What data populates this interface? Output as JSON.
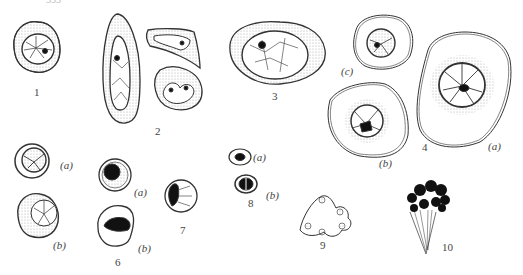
{
  "figure": {
    "top_fragment": "555",
    "panels": [
      {
        "id": "1",
        "label": "1"
      },
      {
        "id": "2",
        "label": "2"
      },
      {
        "id": "3",
        "label": "3"
      },
      {
        "id": "4",
        "label": "4",
        "parts": [
          {
            "label": "(a)"
          },
          {
            "label": "(b)"
          },
          {
            "label": "(c)"
          }
        ]
      },
      {
        "id": "5",
        "parts": [
          {
            "label": "(a)"
          },
          {
            "label": "(b)"
          }
        ]
      },
      {
        "id": "6",
        "label": "6",
        "parts": [
          {
            "label": "(a)"
          },
          {
            "label": "(b)"
          }
        ]
      },
      {
        "id": "7",
        "label": "7"
      },
      {
        "id": "8",
        "label": "8",
        "parts": [
          {
            "label": "(a)"
          },
          {
            "label": "(b)"
          }
        ]
      },
      {
        "id": "9",
        "label": "9"
      },
      {
        "id": "10",
        "label": "10"
      }
    ]
  }
}
